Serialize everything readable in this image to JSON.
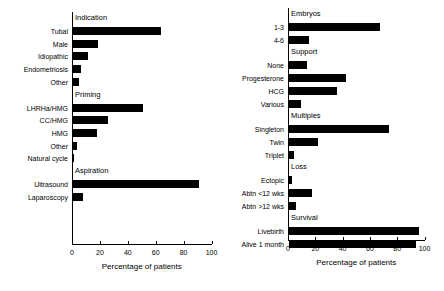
{
  "figure": {
    "panels": [
      {
        "id": "left",
        "xlabel": "Percentage of patients",
        "xticks": [
          0,
          20,
          40,
          60,
          80,
          100
        ],
        "xlim": [
          0,
          100
        ],
        "groups": [
          {
            "label": "Indication",
            "items": [
              {
                "label": "Tubal",
                "value": 63
              },
              {
                "label": "Male",
                "value": 18
              },
              {
                "label": "Idiopathic",
                "value": 11
              },
              {
                "label": "Endometriosis",
                "value": 6
              },
              {
                "label": "Other",
                "value": 4
              }
            ]
          },
          {
            "label": "Priming",
            "items": [
              {
                "label": "LHRHa/HMG",
                "value": 50
              },
              {
                "label": "CC/HMG",
                "value": 25
              },
              {
                "label": "HMG",
                "value": 17
              },
              {
                "label": "Other",
                "value": 3
              },
              {
                "label": "Natural cycle",
                "value": 0.5
              }
            ]
          },
          {
            "label": "Aspiration",
            "items": [
              {
                "label": "Ultrasound",
                "value": 90
              },
              {
                "label": "Laparoscopy",
                "value": 7
              }
            ]
          }
        ]
      },
      {
        "id": "right",
        "xlabel": "Percentage of patients",
        "xticks": [
          0,
          20,
          40,
          60,
          80,
          100
        ],
        "xlim": [
          0,
          100
        ],
        "groups": [
          {
            "label": "Embryos",
            "items": [
              {
                "label": "1-3",
                "value": 67
              },
              {
                "label": "4-6",
                "value": 15
              }
            ]
          },
          {
            "label": "Support",
            "items": [
              {
                "label": "None",
                "value": 13
              },
              {
                "label": "Progesterone",
                "value": 42
              },
              {
                "label": "HCG",
                "value": 35
              },
              {
                "label": "Various",
                "value": 9
              }
            ]
          },
          {
            "label": "Multiples",
            "items": [
              {
                "label": "Singleton",
                "value": 73
              },
              {
                "label": "Twin",
                "value": 21
              },
              {
                "label": "Triplet",
                "value": 4
              }
            ]
          },
          {
            "label": "Loss",
            "items": [
              {
                "label": "Ectopic",
                "value": 2
              },
              {
                "label": "Abtn <12 wks",
                "value": 17
              },
              {
                "label": "Abtn >12 wks",
                "value": 5
              }
            ]
          },
          {
            "label": "Survival",
            "items": [
              {
                "label": "Livebirth",
                "value": 95
              },
              {
                "label": "Alive 1 month",
                "value": 93
              }
            ]
          }
        ]
      }
    ]
  },
  "chart_data": {
    "type": "bar",
    "title": "",
    "orientation": "horizontal",
    "xlabel": "Percentage of patients",
    "ylabel": "",
    "xlim": [
      0,
      100
    ],
    "xticks": [
      0,
      20,
      40,
      60,
      80,
      100
    ],
    "grid": false,
    "legend": "none",
    "bar_color": "#000000",
    "panels": [
      {
        "name": "left",
        "xlabel": "Percentage of patients",
        "categories": [
          "Tubal",
          "Male",
          "Idiopathic",
          "Endometriosis",
          "Other",
          "LHRHa/HMG",
          "CC/HMG",
          "HMG",
          "Other",
          "Natural cycle",
          "Ultrasound",
          "Laparoscopy"
        ],
        "values": [
          63,
          18,
          11,
          6,
          4,
          50,
          25,
          17,
          3,
          0.5,
          90,
          7
        ],
        "group_headings": [
          "Indication",
          "Priming",
          "Aspiration"
        ],
        "group_sizes": [
          5,
          5,
          2
        ]
      },
      {
        "name": "right",
        "xlabel": "Percentage of patients",
        "categories": [
          "1-3",
          "4-6",
          "None",
          "Progesterone",
          "HCG",
          "Various",
          "Singleton",
          "Twin",
          "Triplet",
          "Ectopic",
          "Abtn <12 wks",
          "Abtn >12 wks",
          "Livebirth",
          "Alive 1 month"
        ],
        "values": [
          67,
          15,
          13,
          42,
          35,
          9,
          73,
          21,
          4,
          2,
          17,
          5,
          95,
          93
        ],
        "group_headings": [
          "Embryos",
          "Support",
          "Multiples",
          "Loss",
          "Survival"
        ],
        "group_sizes": [
          2,
          4,
          3,
          3,
          2
        ]
      }
    ]
  }
}
